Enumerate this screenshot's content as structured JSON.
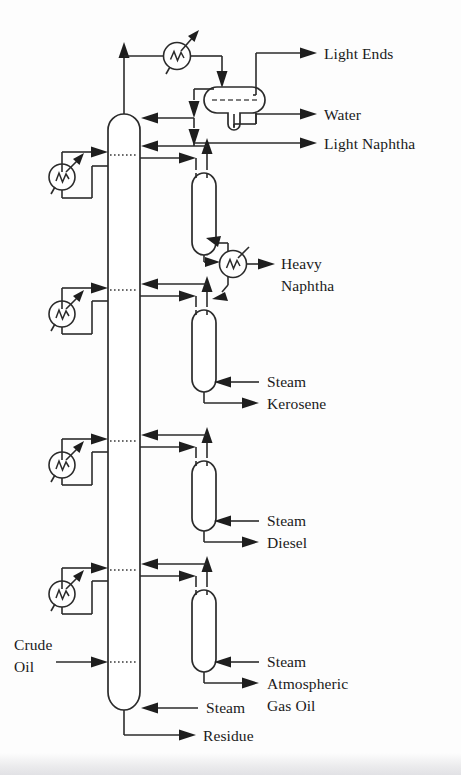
{
  "diagram": {
    "type": "process-flow-diagram",
    "canvas": {
      "width": 461,
      "height": 775
    },
    "style": {
      "line_color": "#2b2b2b",
      "text_color": "#1a1a1a",
      "background": "#fdfdfd"
    },
    "labels": {
      "light_ends": "Light Ends",
      "water": "Water",
      "light_naphtha": "Light Naphtha",
      "heavy_naphtha_l1": "Heavy",
      "heavy_naphtha_l2": "Naphtha",
      "steam_kero": "Steam",
      "kerosene": "Kerosene",
      "steam_diesel": "Steam",
      "diesel": "Diesel",
      "steam_ago": "Steam",
      "ago_l1": "Atmospheric",
      "ago_l2": "Gas Oil",
      "crude_l1": "Crude",
      "crude_l2": "Oil",
      "steam_bottom": "Steam",
      "residue": "Residue"
    },
    "equipment": [
      {
        "name": "main-column",
        "label": "Atmospheric Crude Column",
        "kind": "distillation-column"
      },
      {
        "name": "overhead-condenser",
        "label": "Overhead Condenser",
        "kind": "heat-exchanger"
      },
      {
        "name": "overhead-drum",
        "label": "Overhead Accumulator Drum",
        "kind": "three-phase-drum"
      },
      {
        "name": "heavy-naphtha-stripper",
        "label": "Heavy Naphtha Stripper",
        "kind": "side-stripper"
      },
      {
        "name": "kerosene-stripper",
        "label": "Kerosene Stripper",
        "kind": "side-stripper"
      },
      {
        "name": "diesel-stripper",
        "label": "Diesel Stripper",
        "kind": "side-stripper"
      },
      {
        "name": "ago-stripper",
        "label": "Atmospheric Gas Oil Stripper",
        "kind": "side-stripper"
      },
      {
        "name": "heavy-naphtha-cooler",
        "label": "Heavy Naphtha Cooler",
        "kind": "heat-exchanger"
      },
      {
        "name": "pumparound-cooler-1",
        "label": "Top Pumparound Cooler",
        "kind": "heat-exchanger"
      },
      {
        "name": "pumparound-cooler-2",
        "label": "Upper Middle Pumparound Cooler",
        "kind": "heat-exchanger"
      },
      {
        "name": "pumparound-cooler-3",
        "label": "Lower Middle Pumparound Cooler",
        "kind": "heat-exchanger"
      },
      {
        "name": "pumparound-cooler-4",
        "label": "Bottom Pumparound Cooler",
        "kind": "heat-exchanger"
      }
    ],
    "streams": [
      {
        "name": "crude-oil-feed",
        "label": "Crude Oil",
        "direction": "in"
      },
      {
        "name": "light-ends-product",
        "label": "Light Ends",
        "direction": "out"
      },
      {
        "name": "water-product",
        "label": "Water",
        "direction": "out"
      },
      {
        "name": "light-naphtha-product",
        "label": "Light Naphtha",
        "direction": "out"
      },
      {
        "name": "heavy-naphtha-product",
        "label": "Heavy Naphtha",
        "direction": "out"
      },
      {
        "name": "kerosene-product",
        "label": "Kerosene",
        "direction": "out"
      },
      {
        "name": "diesel-product",
        "label": "Diesel",
        "direction": "out"
      },
      {
        "name": "atmospheric-gas-oil-product",
        "label": "Atmospheric Gas Oil",
        "direction": "out"
      },
      {
        "name": "residue-product",
        "label": "Residue",
        "direction": "out"
      },
      {
        "name": "steam-kerosene-stripper",
        "label": "Steam",
        "direction": "in"
      },
      {
        "name": "steam-diesel-stripper",
        "label": "Steam",
        "direction": "in"
      },
      {
        "name": "steam-ago-stripper",
        "label": "Steam",
        "direction": "in"
      },
      {
        "name": "steam-column-bottom",
        "label": "Steam",
        "direction": "in"
      }
    ]
  }
}
